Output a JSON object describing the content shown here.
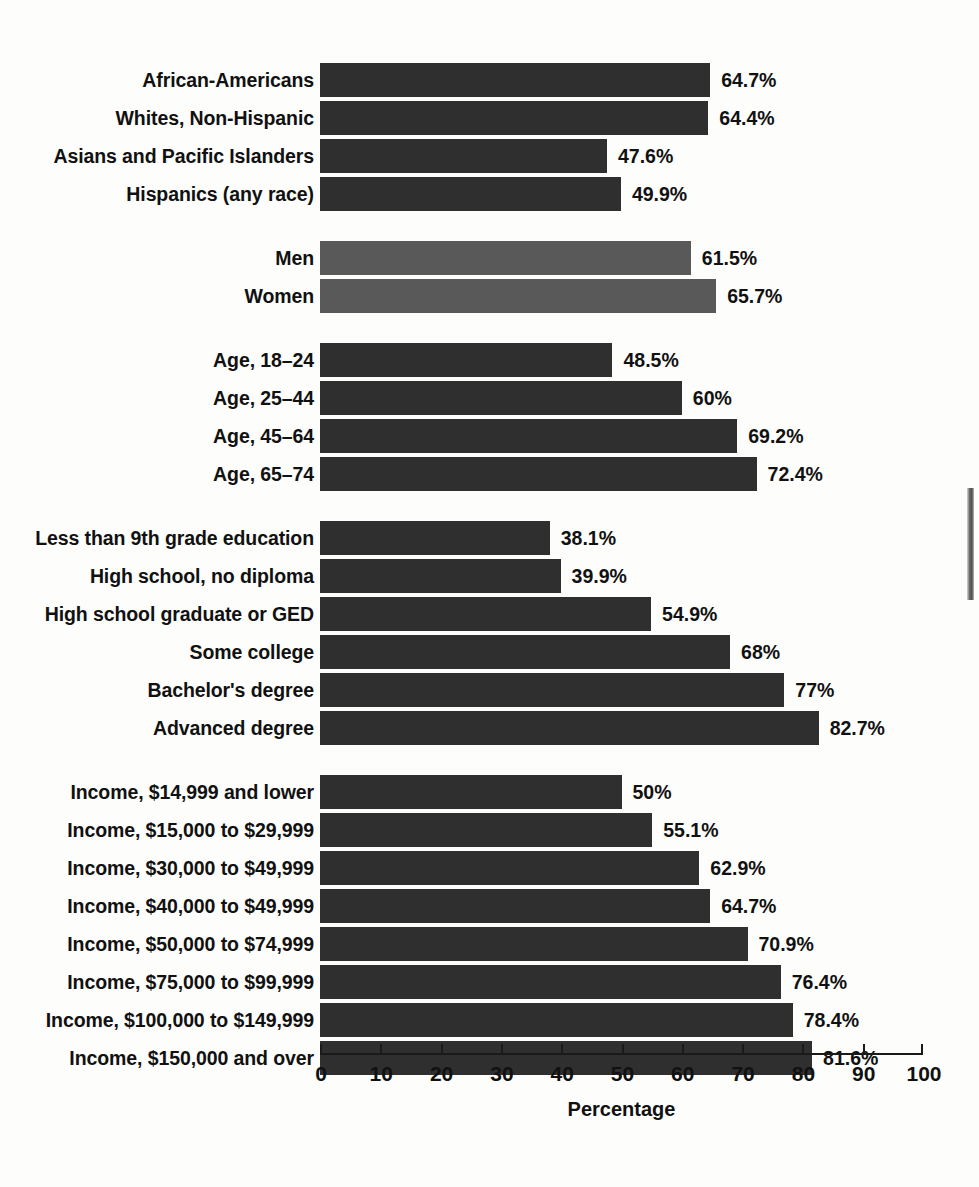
{
  "chart_data": {
    "type": "bar",
    "orientation": "horizontal",
    "title": "",
    "xlabel": "Percentage",
    "ylabel": "",
    "xlim": [
      0,
      100
    ],
    "xticks": [
      0,
      10,
      20,
      30,
      40,
      50,
      60,
      70,
      80,
      90,
      100
    ],
    "xtick_labels": [
      "0",
      "10",
      "20",
      "30",
      "40",
      "50",
      "60",
      "70",
      "80",
      "90",
      "100"
    ],
    "grid": false,
    "legend": null,
    "value_label_suffix": "%",
    "colors": {
      "bar_dark": "#2f2f2f",
      "bar_light": "#595959",
      "background": "#fdfdfb",
      "text": "#111111"
    },
    "groups": [
      {
        "name": "race-ethnicity",
        "shade": "dark",
        "categories": [
          "African-Americans",
          "Whites, Non-Hispanic",
          "Asians and Pacific Islanders",
          "Hispanics (any race)"
        ],
        "values": [
          64.7,
          64.4,
          47.6,
          49.9
        ],
        "value_labels": [
          "64.7%",
          "64.4%",
          "47.6%",
          "49.9%"
        ]
      },
      {
        "name": "sex",
        "shade": "light",
        "categories": [
          "Men",
          "Women"
        ],
        "values": [
          61.5,
          65.7
        ],
        "value_labels": [
          "61.5%",
          "65.7%"
        ]
      },
      {
        "name": "age",
        "shade": "dark",
        "categories": [
          "Age, 18–24",
          "Age, 25–44",
          "Age, 45–64",
          "Age, 65–74"
        ],
        "values": [
          48.5,
          60,
          69.2,
          72.4
        ],
        "value_labels": [
          "48.5%",
          "60%",
          "69.2%",
          "72.4%"
        ]
      },
      {
        "name": "education",
        "shade": "dark",
        "categories": [
          "Less than 9th grade education",
          "High school, no diploma",
          "High school graduate or GED",
          "Some college",
          "Bachelor's degree",
          "Advanced degree"
        ],
        "values": [
          38.1,
          39.9,
          54.9,
          68,
          77,
          82.7
        ],
        "value_labels": [
          "38.1%",
          "39.9%",
          "54.9%",
          "68%",
          "77%",
          "82.7%"
        ]
      },
      {
        "name": "income",
        "shade": "dark",
        "categories": [
          "Income, $14,999 and lower",
          "Income, $15,000 to $29,999",
          "Income, $30,000 to $49,999",
          "Income, $40,000 to $49,999",
          "Income, $50,000 to $74,999",
          "Income, $75,000 to $99,999",
          "Income, $100,000 to $149,999",
          "Income, $150,000 and over"
        ],
        "values": [
          50,
          55.1,
          62.9,
          64.7,
          70.9,
          76.4,
          78.4,
          81.6
        ],
        "value_labels": [
          "50%",
          "55.1%",
          "62.9%",
          "64.7%",
          "70.9%",
          "76.4%",
          "78.4%",
          "81.6%"
        ]
      }
    ]
  }
}
